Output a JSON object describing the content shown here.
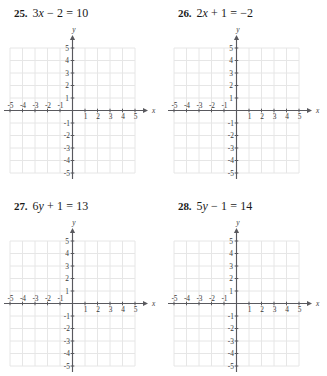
{
  "page": {
    "background_color": "#ffffff",
    "text_color": "#1a1a1a"
  },
  "grid_style": {
    "gridline_color": "#e6e6e6",
    "axis_color": "#59595e",
    "tick_label_color": "#3a3a3a"
  },
  "axes": {
    "x_label": "x",
    "y_label": "y",
    "x_min": -5,
    "x_max": 5,
    "y_min": -5,
    "y_max": 5,
    "x_tick_labels_negative": [
      "-5",
      "-4",
      "-3",
      "-2",
      "-1"
    ],
    "x_tick_labels_positive": [
      "1",
      "2",
      "3",
      "4",
      "5"
    ],
    "y_tick_labels_positive": [
      "5",
      "4",
      "3",
      "2",
      "1"
    ],
    "y_tick_labels_negative": [
      "-1",
      "-2",
      "-3",
      "-4",
      "-5"
    ]
  },
  "problems": [
    {
      "number": "25.",
      "equation_parts": {
        "a": "3",
        "var": "x",
        "b": " − 2 = 10"
      },
      "equation_text": "3x − 2 = 10"
    },
    {
      "number": "26.",
      "equation_parts": {
        "a": "2",
        "var": "x",
        "b": " + 1 = −2"
      },
      "equation_text": "2x + 1 = −2"
    },
    {
      "number": "27.",
      "equation_parts": {
        "a": "6",
        "var": "y",
        "b": " + 1 = 13"
      },
      "equation_text": "6y + 1 = 13"
    },
    {
      "number": "28.",
      "equation_parts": {
        "a": "5",
        "var": "y",
        "b": " − 1 = 14"
      },
      "equation_text": "5y − 1 = 14"
    }
  ]
}
